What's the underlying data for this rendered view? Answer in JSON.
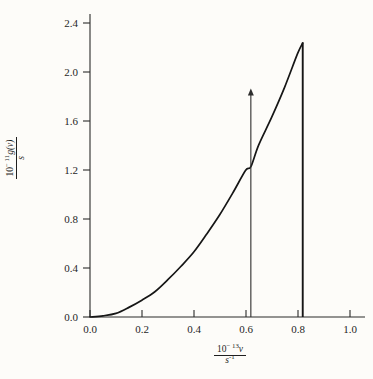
{
  "chart_data": {
    "type": "line",
    "title": "",
    "subtitle": "",
    "xlabel": "10^-13 v / s^-1",
    "ylabel": "10^-11 g(v) / s",
    "xlabel_parts": {
      "numerator_prefix": "10",
      "numerator_exponent": "− 13",
      "numerator_var": "v",
      "denominator_base": "s",
      "denominator_exponent": "-1"
    },
    "ylabel_parts": {
      "numerator_prefix": "10",
      "numerator_exponent": "− 11",
      "numerator_var": "g(v)",
      "denominator_base": "s"
    },
    "xlim": [
      0.0,
      1.06
    ],
    "ylim": [
      0.0,
      2.52
    ],
    "xticks": [
      "0.0",
      "0.2",
      "0.4",
      "0.6",
      "0.8",
      "1.0"
    ],
    "xtick_values": [
      0.0,
      0.2,
      0.4,
      0.6,
      0.8,
      1.0
    ],
    "yticks": [
      "0.0",
      "0.4",
      "0.8",
      "1.2",
      "1.6",
      "2.0",
      "2.4"
    ],
    "ytick_values": [
      0.0,
      0.4,
      0.8,
      1.2,
      1.6,
      2.0,
      2.4
    ],
    "grid": false,
    "legend": false,
    "series": [
      {
        "name": "g(v) Debye density of states",
        "description": "quadratic rise, g proportional to v squared, truncated at Debye cutoff",
        "x": [
          0.0,
          0.05,
          0.1,
          0.15,
          0.2,
          0.25,
          0.3,
          0.35,
          0.4,
          0.45,
          0.5,
          0.55,
          0.6,
          0.62,
          0.65,
          0.7,
          0.75,
          0.8,
          0.82
        ],
        "y": [
          0.0,
          0.01,
          0.03,
          0.08,
          0.14,
          0.21,
          0.31,
          0.42,
          0.54,
          0.69,
          0.85,
          1.03,
          1.22,
          1.25,
          1.43,
          1.66,
          1.91,
          2.19,
          2.28
        ]
      }
    ],
    "annotations": [
      {
        "name": "debye-cutoff-line",
        "type": "vline",
        "x": 0.82,
        "y_from": 0.0,
        "y_to": 2.28,
        "label": ""
      },
      {
        "name": "frequency-marker-arrow",
        "type": "arrow",
        "x": 0.62,
        "y_from": 0.0,
        "y_to": 1.9,
        "label": ""
      }
    ],
    "colors": {
      "background": "#fdfcf9",
      "curve": "#161616",
      "axis": "#2a2a2a",
      "cutoff": "#161616",
      "marker": "#2e2e2e",
      "text": "#1f1f1f"
    }
  }
}
